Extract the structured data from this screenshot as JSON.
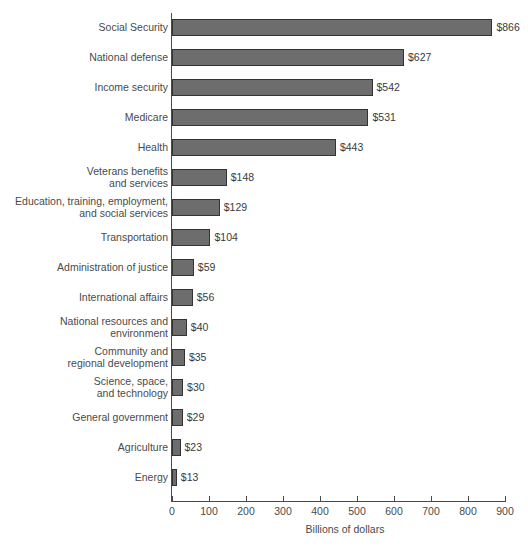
{
  "chart_data": {
    "type": "bar",
    "orientation": "horizontal",
    "title": "",
    "xlabel": "Billions of dollars",
    "ylabel": "",
    "xlim": [
      0,
      900
    ],
    "xticks": [
      0,
      100,
      200,
      300,
      400,
      500,
      600,
      700,
      800,
      900
    ],
    "xtick_labels": [
      "0",
      "100",
      "200",
      "300",
      "400",
      "500",
      "600",
      "700",
      "800",
      "900"
    ],
    "grid": false,
    "legend": false,
    "bar_color": "#6d6d6d",
    "bar_edge_color": "#333333",
    "axis_color": "#4a4a4a",
    "categories": [
      "Social Security",
      "National defense",
      "Income security",
      "Medicare",
      "Health",
      "Veterans benefits\nand services",
      "Education, training, employment,\nand social services",
      "Transportation",
      "Administration of justice",
      "International affairs",
      "National resources and\nenvironment",
      "Community and\nregional development",
      "Science, space,\nand technology",
      "General government",
      "Agriculture",
      "Energy"
    ],
    "values": [
      866,
      627,
      542,
      531,
      443,
      148,
      129,
      104,
      59,
      56,
      40,
      35,
      30,
      29,
      23,
      13
    ],
    "value_labels": [
      "$866",
      "$627",
      "$542",
      "$531",
      "$443",
      "$148",
      "$129",
      "$104",
      "$59",
      "$56",
      "$40",
      "$35",
      "$30",
      "$29",
      "$23",
      "$13"
    ]
  }
}
